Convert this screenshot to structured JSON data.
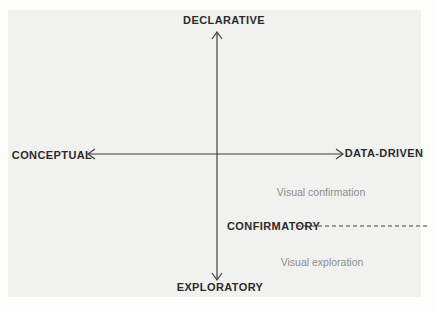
{
  "figure": {
    "name": "visualization-intent-quadrant",
    "axes": {
      "top_label": "DECLARATIVE",
      "bottom_label": "EXPLORATORY",
      "left_label": "CONCEPTUAL",
      "right_label": "DATA-DRIVEN"
    },
    "threshold": {
      "label": "CONFIRMATORY"
    },
    "quadrants": {
      "right_upper_of_threshold": "Visual confirmation",
      "right_lower_of_threshold": "Visual exploration"
    },
    "colors": {
      "page_background": "#fdfdfc",
      "panel_background": "#f1f1ef",
      "axis_line": "#3f3f3f",
      "axis_label_text": "#2b2b2b",
      "quadrant_text": "#8e8e8e"
    }
  }
}
